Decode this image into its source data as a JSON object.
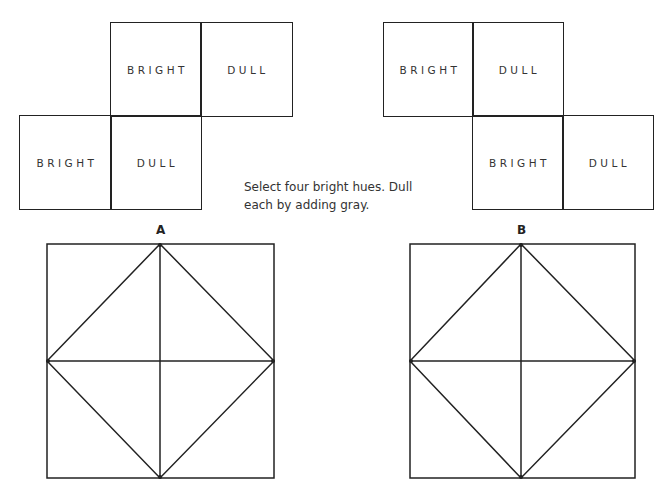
{
  "layout_a": {
    "cells": [
      {
        "label": "BRIGHT",
        "position": "top-row, column 2"
      },
      {
        "label": "DULL",
        "position": "top-row, column 3"
      },
      {
        "label": "BRIGHT",
        "position": "bottom-row, column 1"
      },
      {
        "label": "DULL",
        "position": "bottom-row, column 2"
      }
    ]
  },
  "layout_b": {
    "cells": [
      {
        "label": "BRIGHT",
        "position": "top-row, column 1"
      },
      {
        "label": "DULL",
        "position": "top-row, column 2"
      },
      {
        "label": "BRIGHT",
        "position": "bottom-row, column 2"
      },
      {
        "label": "DULL",
        "position": "bottom-row, column 3"
      }
    ]
  },
  "instruction": "Select four bright hues. Dull each by adding gray.",
  "diagrams": [
    {
      "label": "A",
      "description": "Square with inscribed diamond and center cross dividing it into 8 triangles"
    },
    {
      "label": "B",
      "description": "Square with inscribed diamond and center cross dividing it into 8 triangles"
    }
  ],
  "colors": {
    "line": "#222222",
    "background": "#ffffff"
  }
}
